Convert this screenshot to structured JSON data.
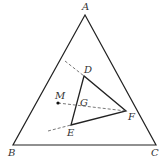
{
  "diagram": {
    "type": "geometry",
    "points": {
      "A": {
        "label": "A",
        "x": 85,
        "y": 15,
        "lx": 82,
        "ly": 10
      },
      "B": {
        "label": "B",
        "x": 13,
        "y": 145,
        "lx": 8,
        "ly": 156
      },
      "C": {
        "label": "C",
        "x": 156,
        "y": 145,
        "lx": 151,
        "ly": 156
      },
      "D": {
        "label": "D",
        "x": 84,
        "y": 76,
        "lx": 84,
        "ly": 73
      },
      "E": {
        "label": "E",
        "x": 71,
        "y": 125,
        "lx": 67,
        "ly": 136
      },
      "F": {
        "label": "F",
        "x": 126,
        "y": 111,
        "lx": 128,
        "ly": 120
      },
      "M": {
        "label": "M",
        "x": 58,
        "y": 103,
        "lx": 55,
        "ly": 99
      },
      "G": {
        "label": "G",
        "x": 79,
        "y": 105,
        "lx": 80,
        "ly": 106
      }
    },
    "solid_segments": [
      [
        "A",
        "B"
      ],
      [
        "B",
        "C"
      ],
      [
        "C",
        "A"
      ],
      [
        "D",
        "E"
      ],
      [
        "E",
        "F"
      ],
      [
        "F",
        "D"
      ]
    ],
    "dashed_segments": [
      {
        "from": [
          65,
          61
        ],
        "to": "D"
      },
      {
        "from": [
          48,
          131
        ],
        "to": "E"
      },
      {
        "from": "M",
        "to": "F"
      }
    ],
    "labels": {
      "A": "A",
      "B": "B",
      "C": "C",
      "D": "D",
      "E": "E",
      "F": "F",
      "G": "G",
      "M": "M"
    },
    "colors": {
      "line": "#222222",
      "dash": "#555555",
      "label": "#333333"
    }
  }
}
